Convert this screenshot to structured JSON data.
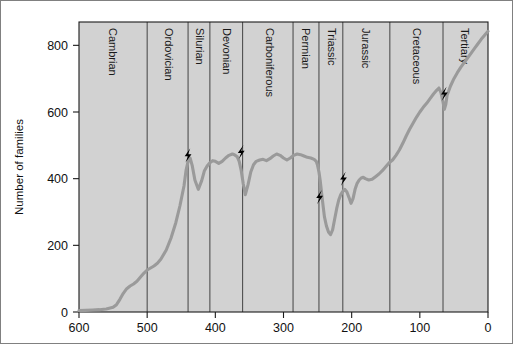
{
  "chart_data": {
    "type": "line",
    "title": "",
    "xlabel": "Millions of years ago",
    "ylabel": "Number of families",
    "xlim": [
      600,
      0
    ],
    "ylim": [
      0,
      870
    ],
    "x_ticks": [
      600,
      500,
      400,
      300,
      200,
      100,
      0
    ],
    "y_ticks": [
      0,
      200,
      400,
      600,
      800
    ],
    "x_axis_reversed": true,
    "grid": false,
    "legend": null,
    "series": [
      {
        "name": "Number of marine families",
        "x": [
          600,
          590,
          580,
          570,
          560,
          550,
          545,
          540,
          535,
          530,
          525,
          520,
          515,
          510,
          505,
          500,
          495,
          490,
          485,
          480,
          472,
          465,
          458,
          452,
          446,
          443,
          440,
          437,
          434,
          430,
          425,
          420,
          416,
          412,
          408,
          404,
          400,
          395,
          390,
          385,
          380,
          375,
          372,
          368,
          365,
          362,
          359,
          356,
          352,
          348,
          344,
          340,
          335,
          330,
          325,
          320,
          315,
          310,
          305,
          300,
          295,
          290,
          285,
          280,
          275,
          270,
          265,
          260,
          255,
          252,
          250,
          248,
          246,
          244,
          242,
          240,
          237,
          234,
          231,
          228,
          225,
          222,
          219,
          216,
          213,
          210,
          207,
          204,
          201,
          198,
          195,
          192,
          189,
          186,
          183,
          180,
          175,
          170,
          165,
          160,
          155,
          150,
          145,
          140,
          135,
          130,
          125,
          120,
          115,
          110,
          105,
          100,
          95,
          90,
          85,
          80,
          75,
          72,
          69,
          66,
          64,
          62,
          60,
          55,
          50,
          45,
          40,
          35,
          30,
          25,
          20,
          15,
          10,
          5,
          0
        ],
        "y": [
          4,
          5,
          6,
          7,
          9,
          14,
          22,
          38,
          56,
          70,
          78,
          84,
          92,
          104,
          116,
          126,
          132,
          138,
          146,
          158,
          186,
          222,
          268,
          318,
          378,
          424,
          452,
          462,
          440,
          396,
          368,
          394,
          424,
          438,
          448,
          454,
          452,
          446,
          452,
          462,
          470,
          474,
          472,
          466,
          452,
          424,
          384,
          352,
          382,
          420,
          442,
          452,
          456,
          458,
          454,
          460,
          468,
          474,
          470,
          462,
          456,
          462,
          470,
          474,
          472,
          468,
          464,
          462,
          458,
          452,
          440,
          420,
          392,
          356,
          320,
          286,
          258,
          240,
          232,
          246,
          278,
          310,
          336,
          352,
          362,
          368,
          360,
          344,
          326,
          340,
          368,
          386,
          396,
          402,
          404,
          400,
          396,
          398,
          406,
          414,
          424,
          436,
          448,
          456,
          470,
          486,
          506,
          528,
          548,
          566,
          584,
          600,
          614,
          626,
          640,
          654,
          666,
          672,
          658,
          630,
          608,
          622,
          650,
          678,
          700,
          718,
          734,
          748,
          762,
          776,
          790,
          804,
          818,
          830,
          842
        ]
      }
    ],
    "periods": [
      {
        "name": "Cambrian",
        "start": 600,
        "end": 500,
        "label_x": 552
      },
      {
        "name": "Ordovician",
        "start": 500,
        "end": 440,
        "label_x": 470
      },
      {
        "name": "Silurian",
        "start": 440,
        "end": 408,
        "label_x": 424
      },
      {
        "name": "Devonian",
        "start": 408,
        "end": 360,
        "label_x": 384
      },
      {
        "name": "Carboniferous",
        "start": 360,
        "end": 286,
        "label_x": 322
      },
      {
        "name": "Permian",
        "start": 286,
        "end": 248,
        "label_x": 268
      },
      {
        "name": "Triassic",
        "start": 248,
        "end": 213,
        "label_x": 230
      },
      {
        "name": "Jurassic",
        "start": 213,
        "end": 144,
        "label_x": 180
      },
      {
        "name": "Cretaceous",
        "start": 144,
        "end": 66,
        "label_x": 106
      },
      {
        "name": "Tertiary",
        "start": 66,
        "end": 0,
        "label_x": 36
      }
    ],
    "extinction_markers": [
      {
        "name": "end-Ordovician",
        "x": 440,
        "y": 470
      },
      {
        "name": "late-Devonian",
        "x": 362,
        "y": 480
      },
      {
        "name": "end-Permian",
        "x": 247,
        "y": 345
      },
      {
        "name": "end-Triassic",
        "x": 212,
        "y": 400
      },
      {
        "name": "end-Cretaceous",
        "x": 64,
        "y": 655
      }
    ],
    "colors": {
      "plot_background": "#d2d2d2",
      "curve": "#9a9a9a",
      "axis": "#1a1a1a",
      "period_line": "#4a4a4a",
      "marker": "#000000",
      "page_background": "#ffffff"
    }
  }
}
